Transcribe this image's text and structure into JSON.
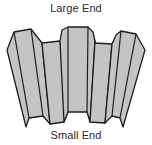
{
  "diagram": {
    "title_top": "Large End",
    "title_bottom": "Small End",
    "fill_color": "#c4c4c4",
    "stroke_color": "#1e1e1e",
    "shape": "tapered-fluted-cone-segment"
  }
}
